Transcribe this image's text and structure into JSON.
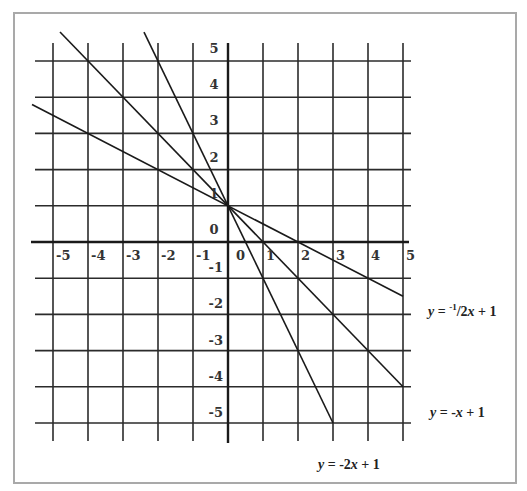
{
  "chart_data": {
    "type": "line",
    "title": "",
    "xlabel": "",
    "ylabel": "",
    "xlim": [
      -5,
      5
    ],
    "ylim": [
      -5,
      5
    ],
    "grid": true,
    "x_ticks": [
      "-5",
      "-4",
      "-3",
      "-2",
      "-1",
      "0",
      "1",
      "2",
      "3",
      "4",
      "5"
    ],
    "y_ticks": [
      "5",
      "4",
      "3",
      "2",
      "1",
      "0",
      "-1",
      "-2",
      "-3",
      "-4",
      "-5"
    ],
    "series": [
      {
        "name": "y = -1/2x + 1",
        "label_display": {
          "prefix": "y = ",
          "sup": "-1",
          "rest": "/2x + 1"
        },
        "slope": -0.5,
        "intercept": 1,
        "x": [
          -5.6,
          5.0
        ],
        "y": [
          3.8,
          -1.5
        ]
      },
      {
        "name": "y = -x + 1",
        "label_display": {
          "prefix": "y = ",
          "rest": "-x + 1"
        },
        "slope": -1,
        "intercept": 1,
        "x": [
          -4.8,
          5.0
        ],
        "y": [
          5.8,
          -4.0
        ]
      },
      {
        "name": "y = -2x + 1",
        "label_display": {
          "prefix": "y = ",
          "rest": "-2x + 1"
        },
        "slope": -2,
        "intercept": 1,
        "x": [
          -2.4,
          3.0
        ],
        "y": [
          5.8,
          -5.0
        ]
      }
    ],
    "intersection": {
      "x": 0,
      "y": 1
    },
    "annotations": [
      "y = -1/2x + 1",
      "y = -x + 1",
      "y = -2x + 1"
    ]
  },
  "labels": {
    "eq1": {
      "y": "y",
      "eq": " = ",
      "sup": "-1",
      "frac": "/2",
      "x": "x",
      "tail": " + 1"
    },
    "eq2": {
      "y": "y",
      "eq": " = -",
      "x": "x",
      "tail": " + 1"
    },
    "eq3": {
      "y": "y",
      "eq": " = -2",
      "x": "x",
      "tail": " + 1"
    }
  },
  "axis_labels": {
    "x": [
      "-5",
      "-4",
      "-3",
      "-2",
      "-1",
      "0",
      "1",
      "2",
      "3",
      "4",
      "5"
    ],
    "y_pos": [
      "5",
      "4",
      "3",
      "2",
      "1",
      "0"
    ],
    "y_neg": [
      "-1",
      "-2",
      "-3",
      "-4",
      "-5"
    ]
  },
  "colors": {
    "grid": "#2b2b2b",
    "frame": "#a9a9a9",
    "line": "#1a1a1a"
  }
}
